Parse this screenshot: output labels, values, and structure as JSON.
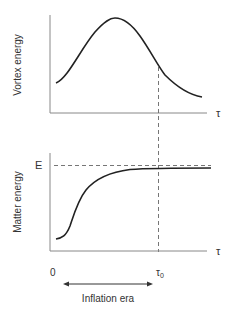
{
  "diagram": {
    "top_panel": {
      "ylabel": "Vortex energy",
      "xlabel": "τ",
      "curve": "rises from low value to a peak then decays (bell-shaped)"
    },
    "bottom_panel": {
      "ylabel": "Matter energy",
      "xlabel": "τ",
      "level_label": "E",
      "curve": "sigmoid rising from near zero, saturating at E"
    },
    "x_markers": {
      "origin": "0",
      "tau0": "τ",
      "tau0_sub": "0"
    },
    "era_label": "Inflation era",
    "colors": {
      "line": "#222222",
      "axis": "#888888",
      "dash": "#666666",
      "text": "#333333"
    }
  }
}
